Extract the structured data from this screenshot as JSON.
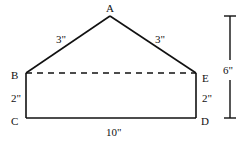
{
  "diagram": {
    "type": "geometry-figure",
    "colors": {
      "stroke": "#111111",
      "background": "#ffffff"
    },
    "vertices": {
      "A": {
        "label": "A"
      },
      "B": {
        "label": "B"
      },
      "C": {
        "label": "C"
      },
      "D": {
        "label": "D"
      },
      "E": {
        "label": "E"
      }
    },
    "segments": [
      {
        "id": "AB",
        "length_label": "3\"",
        "style": "solid"
      },
      {
        "id": "AE",
        "length_label": "3\"",
        "style": "solid"
      },
      {
        "id": "BE",
        "length_label": "",
        "style": "dashed"
      },
      {
        "id": "BC",
        "length_label": "2\"",
        "style": "solid"
      },
      {
        "id": "ED",
        "length_label": "2\"",
        "style": "solid"
      },
      {
        "id": "CD",
        "length_label": "10\"",
        "style": "solid"
      }
    ],
    "dimension": {
      "label": "6\"",
      "description": "Total height from A to CD"
    }
  }
}
